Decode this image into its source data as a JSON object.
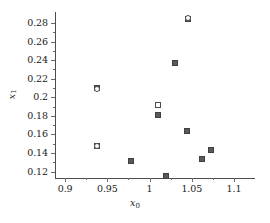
{
  "chart_data": {
    "type": "scatter",
    "title": "",
    "xlabel": "x0",
    "xlabel_base": "x",
    "xlabel_sub": "0",
    "ylabel": "x1",
    "ylabel_base": "x",
    "ylabel_sub": "1",
    "xlim": [
      0.888,
      1.113
    ],
    "ylim": [
      0.113,
      0.292
    ],
    "xticks": [
      0.9,
      0.95,
      1.0,
      1.05,
      1.1
    ],
    "xticklabels": [
      "0.9",
      "0.95",
      "1",
      "1.05",
      "1.1"
    ],
    "yticks": [
      0.12,
      0.14,
      0.16,
      0.18,
      0.2,
      0.22,
      0.24,
      0.26,
      0.28
    ],
    "yticklabels": [
      "0.12",
      "0.14",
      "0.16",
      "0.18",
      "0.2",
      "0.22",
      "0.24",
      "0.26",
      "0.28"
    ],
    "x_minor_ticks": [
      0.925,
      0.975,
      1.025,
      1.075
    ],
    "y_minor_ticks": [
      0.13,
      0.15,
      0.17,
      0.19,
      0.21,
      0.23,
      0.25,
      0.27
    ],
    "grid": false,
    "legend": null,
    "marker_colors": {
      "filled": "#595959",
      "open": "#ffffff",
      "edge": "#4d4d4d",
      "axis": "#4d4d4d",
      "text": "#1a1a1a"
    },
    "points": [
      {
        "x": 0.9375,
        "y": 0.2105,
        "style": "filled",
        "shape": "square"
      },
      {
        "x": 0.9375,
        "y": 0.2095,
        "style": "open",
        "shape": "circle"
      },
      {
        "x": 0.9378,
        "y": 0.147,
        "style": "filled",
        "shape": "square"
      },
      {
        "x": 0.9378,
        "y": 0.148,
        "style": "open",
        "shape": "circle"
      },
      {
        "x": 0.978,
        "y": 0.131,
        "style": "filled",
        "shape": "square"
      },
      {
        "x": 1.01,
        "y": 0.1915,
        "style": "open",
        "shape": "square"
      },
      {
        "x": 1.0105,
        "y": 0.1805,
        "style": "filled",
        "shape": "square"
      },
      {
        "x": 1.02,
        "y": 0.115,
        "style": "filled",
        "shape": "square"
      },
      {
        "x": 1.03,
        "y": 0.237,
        "style": "filled",
        "shape": "square"
      },
      {
        "x": 1.045,
        "y": 0.2848,
        "style": "filled",
        "shape": "square"
      },
      {
        "x": 1.045,
        "y": 0.2852,
        "style": "open",
        "shape": "circle"
      },
      {
        "x": 1.0445,
        "y": 0.1638,
        "style": "filled",
        "shape": "square"
      },
      {
        "x": 1.0615,
        "y": 0.1333,
        "style": "filled",
        "shape": "square"
      },
      {
        "x": 1.0728,
        "y": 0.1437,
        "style": "filled",
        "shape": "square"
      }
    ]
  }
}
